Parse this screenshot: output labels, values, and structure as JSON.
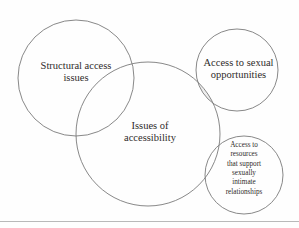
{
  "figure": {
    "background_color": "#fefefe",
    "stroke_color": "#7a7a7a",
    "text_color": "#2f2b2a",
    "overlap_fill": "#d9d9d9",
    "rule_color": "#b9b9b9"
  },
  "circles": [
    {
      "id": "structural-access-issues",
      "label": "Structural access\nissues",
      "cx": 76,
      "cy": 78,
      "r": 58
    },
    {
      "id": "issues-of-accessibility",
      "label": "Issues of\naccessibility",
      "cx": 148,
      "cy": 134,
      "r": 72
    },
    {
      "id": "access-to-sexual-opportunities",
      "label": "Access to sexual\nopportunities",
      "cx": 237,
      "cy": 70,
      "r": 41
    },
    {
      "id": "access-to-resources",
      "label": "Access to\nresources\nthat support\nsexually\nintimate\nrelationships",
      "cx": 244,
      "cy": 175,
      "r": 39
    }
  ],
  "labels": {
    "structural": "Structural access\nissues",
    "sexual_opportunities": "Access to sexual\nopportunities",
    "accessibility": "Issues of\naccessibility",
    "resources": "Access to\nresources\nthat support\nsexually\nintimate\nrelationships"
  }
}
